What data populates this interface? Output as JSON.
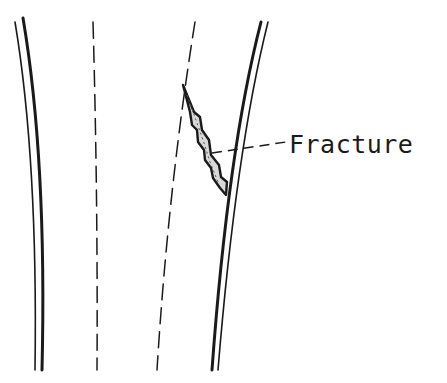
{
  "diagram": {
    "labels": [
      {
        "text": "Fracture",
        "points_to": "fracture-region"
      }
    ],
    "colors": {
      "ink": "#1a1a1a",
      "background": "#ffffff",
      "stipple": "#888888"
    }
  }
}
